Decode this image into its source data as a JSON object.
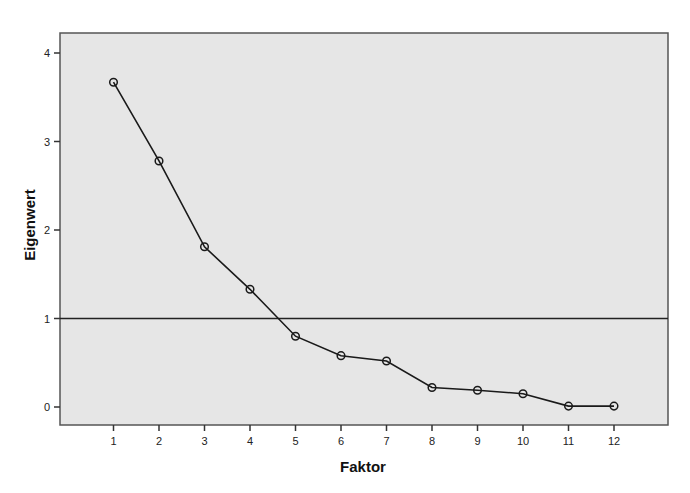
{
  "chart_data": {
    "type": "line",
    "title": "",
    "xlabel": "Faktor",
    "ylabel": "Eigenwert",
    "x": [
      1,
      2,
      3,
      4,
      5,
      6,
      7,
      8,
      9,
      10,
      11,
      12
    ],
    "categories": [
      "1",
      "2",
      "3",
      "4",
      "5",
      "6",
      "7",
      "8",
      "9",
      "10",
      "11",
      "12"
    ],
    "series": [
      {
        "name": "Eigenwert",
        "values": [
          3.67,
          2.78,
          1.81,
          1.33,
          0.8,
          0.58,
          0.52,
          0.22,
          0.19,
          0.15,
          0.01,
          0.01
        ]
      }
    ],
    "reference_line": {
      "y": 1,
      "orientation": "horizontal"
    },
    "yticks": [
      0,
      1,
      2,
      3,
      4
    ],
    "ylim": [
      -0.22,
      4.2
    ],
    "xlim": [
      0,
      13
    ],
    "grid": false,
    "legend": null,
    "marker": "open-circle"
  },
  "colors": {
    "plot_background": "#e6e6e6",
    "line": "#1a1a1a",
    "axis": "#333333"
  }
}
